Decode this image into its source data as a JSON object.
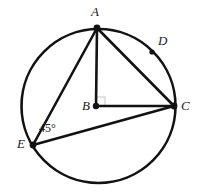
{
  "figure": {
    "type": "circle-geometry-diagram",
    "background_color": "#ffffff",
    "stroke_color": "#121212",
    "circle": {
      "name": "circle-B",
      "center_x": 98.5,
      "center_y": 106,
      "radius": 77,
      "stroke_width": 2.6
    },
    "points": [
      {
        "id": "A",
        "label": "A",
        "x": 97,
        "y": 28,
        "label_x": 91,
        "label_y": 5,
        "dot": true,
        "dot_r": 3.4
      },
      {
        "id": "B",
        "label": "B",
        "x": 96,
        "y": 106,
        "label_x": 82,
        "label_y": 99,
        "dot": true,
        "dot_r": 3.2
      },
      {
        "id": "C",
        "label": "C",
        "x": 174,
        "y": 106,
        "label_x": 181,
        "label_y": 99,
        "dot": true,
        "dot_r": 3.4
      },
      {
        "id": "D",
        "label": "D",
        "x": 152,
        "y": 52,
        "label_x": 158,
        "label_y": 34,
        "dot": true,
        "dot_r": 2.6
      },
      {
        "id": "E",
        "label": "E",
        "x": 33,
        "y": 145,
        "label_x": 17,
        "label_y": 137,
        "dot": true,
        "dot_r": 3.4
      }
    ],
    "segments": [
      {
        "name": "segment-AB",
        "from": "A",
        "to": "B",
        "x1": 97,
        "y1": 28,
        "x2": 96,
        "y2": 106,
        "stroke_width": 2.6
      },
      {
        "name": "segment-AC",
        "from": "A",
        "to": "C",
        "x1": 97,
        "y1": 28,
        "x2": 174,
        "y2": 106,
        "stroke_width": 2.6
      },
      {
        "name": "segment-AE",
        "from": "A",
        "to": "E",
        "x1": 97,
        "y1": 28,
        "x2": 33,
        "y2": 145,
        "stroke_width": 2.6
      },
      {
        "name": "segment-BC",
        "from": "B",
        "to": "C",
        "x1": 96,
        "y1": 106,
        "x2": 174,
        "y2": 106,
        "stroke_width": 2.6
      },
      {
        "name": "segment-EC",
        "from": "E",
        "to": "C",
        "x1": 33,
        "y1": 145,
        "x2": 174,
        "y2": 106,
        "stroke_width": 2.6
      }
    ],
    "right_angle_mark": {
      "name": "right-angle-mark-at-B",
      "at": "B",
      "path": "M 96 97 L 105 97 L 105 106",
      "stroke_color": "#c9c9c9",
      "stroke_width": 1.1
    },
    "angle_labels": [
      {
        "name": "angle-label-45",
        "text": "45°",
        "at_vertex": "E",
        "value": 45,
        "unit": "degrees",
        "label_x": 39,
        "label_y": 122
      }
    ]
  }
}
